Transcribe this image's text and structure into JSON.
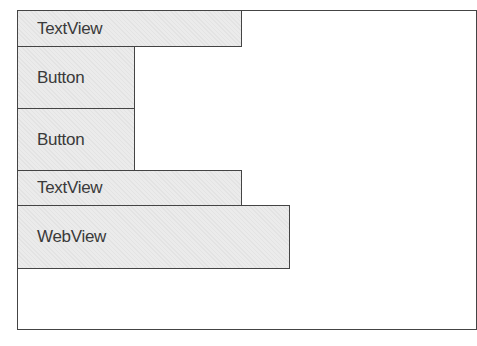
{
  "diagram": {
    "title": "",
    "components": [
      {
        "label": "TextView",
        "type": "TextView"
      },
      {
        "label": "Button",
        "type": "Button"
      },
      {
        "label": "Button",
        "type": "Button"
      },
      {
        "label": "TextView",
        "type": "TextView"
      },
      {
        "label": "WebView",
        "type": "WebView"
      }
    ]
  }
}
